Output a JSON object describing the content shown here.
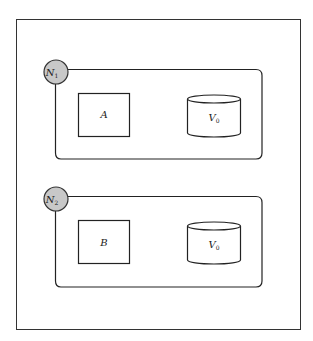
{
  "diagram": {
    "type": "node-deployment",
    "outer_frame": {
      "stroke": "#333333"
    },
    "nodes": [
      {
        "label": "N",
        "subscript": "1",
        "circle_fill": "#c8c8c8",
        "components": [
          {
            "shape": "rectangle",
            "label": "A"
          },
          {
            "shape": "cylinder",
            "label": "V",
            "subscript": "0"
          }
        ]
      },
      {
        "label": "N",
        "subscript": "2",
        "circle_fill": "#c8c8c8",
        "components": [
          {
            "shape": "rectangle",
            "label": "B"
          },
          {
            "shape": "cylinder",
            "label": "V",
            "subscript": "0"
          }
        ]
      }
    ]
  }
}
